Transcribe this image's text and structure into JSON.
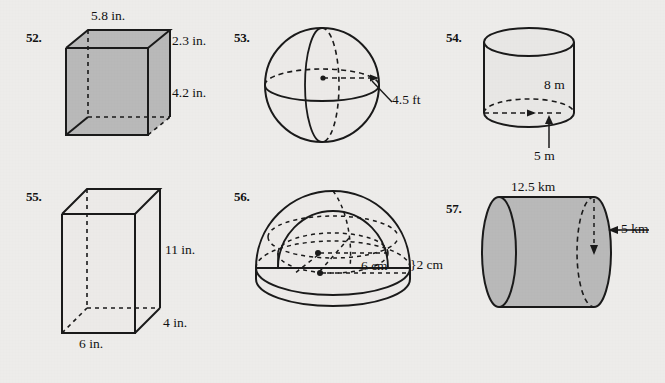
{
  "page": {
    "background_color": "#edecea",
    "ink_color": "#111111",
    "shade_color": "#b9b9b9",
    "light_shade_color": "#e6e5e3"
  },
  "problems": [
    {
      "number": "52.",
      "shape": "rectangular-prism-shaded",
      "shaded": true,
      "labels": [
        {
          "text": "5.8 in.",
          "role": "width-top"
        },
        {
          "text": "2.3 in.",
          "role": "depth-upper-right"
        },
        {
          "text": "4.2 in.",
          "role": "height-right"
        }
      ]
    },
    {
      "number": "53.",
      "shape": "sphere",
      "shaded": false,
      "labels": [
        {
          "text": "4.5 ft",
          "role": "radius"
        }
      ]
    },
    {
      "number": "54.",
      "shape": "cylinder-vertical",
      "shaded": false,
      "labels": [
        {
          "text": "8 m",
          "role": "height"
        },
        {
          "text": "5 m",
          "role": "radius-bottom"
        }
      ]
    },
    {
      "number": "55.",
      "shape": "rectangular-prism-open",
      "shaded": false,
      "labels": [
        {
          "text": "11 in.",
          "role": "height-right"
        },
        {
          "text": "4 in.",
          "role": "depth-lower-right"
        },
        {
          "text": "6 in.",
          "role": "width-bottom"
        }
      ]
    },
    {
      "number": "56.",
      "shape": "hemisphere-on-disc",
      "shaded": false,
      "labels": [
        {
          "text": "6 cm",
          "role": "radius"
        },
        {
          "text": "}2 cm",
          "role": "thickness-brace"
        }
      ]
    },
    {
      "number": "57.",
      "shape": "cylinder-horizontal-shaded",
      "shaded": true,
      "labels": [
        {
          "text": "12.5 km",
          "role": "length-top"
        },
        {
          "text": "5 km",
          "role": "radius-right"
        }
      ]
    }
  ]
}
